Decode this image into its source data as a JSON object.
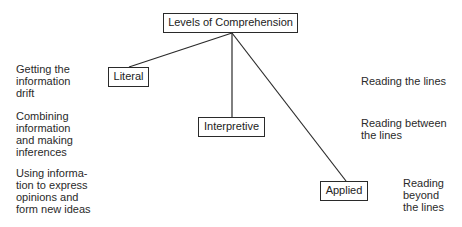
{
  "diagram": {
    "root": {
      "label": "Levels of Comprehension"
    },
    "levels": [
      {
        "label": "Literal",
        "description_lines": [
          "Getting the",
          "information",
          "drift"
        ],
        "reading_lines": [
          "Reading the lines"
        ]
      },
      {
        "label": "Interpretive",
        "description_lines": [
          "Combining",
          "information",
          "and making",
          "inferences"
        ],
        "reading_lines": [
          "Reading between",
          "the lines"
        ]
      },
      {
        "label": "Applied",
        "description_lines": [
          "Using informa-",
          "tion to express",
          "opinions and",
          "form new ideas"
        ],
        "reading_lines": [
          "Reading",
          "beyond",
          "the lines"
        ]
      }
    ],
    "colors": {
      "line": "#2a2a2a",
      "text": "#222222",
      "background": "#ffffff"
    }
  }
}
